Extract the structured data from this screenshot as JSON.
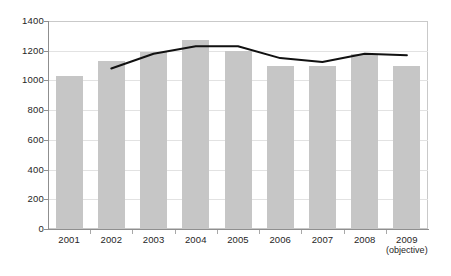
{
  "chart_data": {
    "type": "bar",
    "title": "",
    "subtitle": "",
    "xlabel": "",
    "ylabel": "",
    "ylim": [
      0,
      1400
    ],
    "ytick_step": 200,
    "yticks": [
      "1400",
      "1200",
      "1000",
      "800",
      "600",
      "400",
      "200",
      "0"
    ],
    "ytick_values": [
      1400,
      1200,
      1000,
      800,
      600,
      400,
      200,
      0
    ],
    "grid": true,
    "grid_axis": "y",
    "legend": "none",
    "categories": [
      "2001",
      "2002",
      "2003",
      "2004",
      "2005",
      "2006",
      "2007",
      "2008",
      "2009"
    ],
    "category_sublabels": [
      "",
      "",
      "",
      "",
      "",
      "",
      "",
      "",
      "(objective)"
    ],
    "series": [
      {
        "name": "bars",
        "type": "bar",
        "color": "#c6c6c6",
        "values": [
          1030,
          1130,
          1190,
          1270,
          1200,
          1100,
          1100,
          1180,
          1100
        ]
      },
      {
        "name": "line",
        "type": "line",
        "color": "#111111",
        "x": [
          "2002",
          "2003",
          "2004",
          "2005",
          "2006",
          "2007",
          "2008",
          "2009"
        ],
        "values": [
          1080,
          1180,
          1230,
          1230,
          1150,
          1125,
          1180,
          1170
        ]
      }
    ]
  },
  "axes": {
    "y_max_label": "1400",
    "y_min_label": "0"
  }
}
